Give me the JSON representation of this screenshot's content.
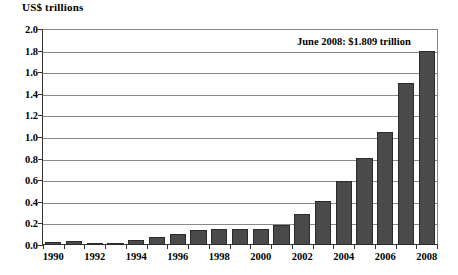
{
  "chart_data": {
    "type": "bar",
    "title": "",
    "ylabel": "US$ trillions",
    "xlabel": "",
    "ylim": [
      0.0,
      2.0
    ],
    "ytick_step": 0.2,
    "grid": true,
    "legend": "none",
    "bar_color": "#4a4a4a",
    "bar_edge_color": "#2b2b2b",
    "categories": [
      "1990",
      "1991",
      "1992",
      "1993",
      "1994",
      "1995",
      "1996",
      "1997",
      "1998",
      "1999",
      "2000",
      "2001",
      "2002",
      "2003",
      "2004",
      "2005",
      "2006",
      "2007",
      "2008"
    ],
    "values": [
      0.03,
      0.04,
      0.02,
      0.02,
      0.05,
      0.07,
      0.1,
      0.14,
      0.15,
      0.15,
      0.15,
      0.19,
      0.29,
      0.41,
      0.6,
      0.81,
      1.05,
      1.51,
      1.809
    ],
    "ytick_labels": [
      "2.0",
      "1.8",
      "1.6",
      "1.4",
      "1.2",
      "1.0",
      "0.8",
      "0.6",
      "0.4",
      "0.2",
      "0.0"
    ],
    "ytick_values": [
      2.0,
      1.8,
      1.6,
      1.4,
      1.2,
      1.0,
      0.8,
      0.6,
      0.4,
      0.2,
      0.0
    ],
    "xtick_labels": [
      "1990",
      "1992",
      "1994",
      "1996",
      "1998",
      "2000",
      "2002",
      "2004",
      "2006",
      "2008"
    ],
    "annotations": [
      {
        "text": "June 2008: $1.809 trillion",
        "x": "2008",
        "y": 1.809
      }
    ]
  }
}
